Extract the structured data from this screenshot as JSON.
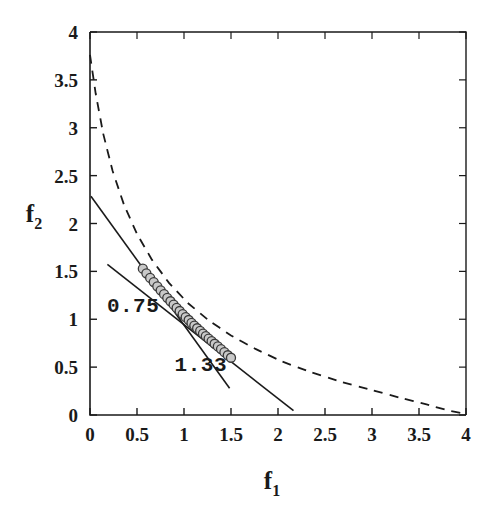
{
  "figure": {
    "background": "#ffffff",
    "ink": "#1a1a1a",
    "marker_fill": "#c9c9c9",
    "marker_edge": "#3a3a3a"
  },
  "chart_data": {
    "type": "scatter",
    "title": "",
    "subtitle": "",
    "xlabel": "f1",
    "ylabel": "f2",
    "xlabel_display": "f",
    "xlabel_sub": "1",
    "ylabel_display": "f",
    "ylabel_sub": "2",
    "xlim": [
      0,
      4
    ],
    "ylim": [
      0,
      4
    ],
    "grid": false,
    "legend": "none",
    "xticks": [
      0,
      0.5,
      1,
      1.5,
      2,
      2.5,
      3,
      3.5,
      4
    ],
    "xticklabels": [
      "0",
      "0.5",
      "1",
      "1.5",
      "2",
      "2.5",
      "3",
      "3.5",
      "4"
    ],
    "yticks": [
      0,
      0.5,
      1,
      1.5,
      2,
      2.5,
      3,
      3.5,
      4
    ],
    "yticklabels": [
      "0",
      "0.5",
      "1",
      "1.5",
      "2",
      "2.5",
      "3",
      "3.5",
      "4"
    ],
    "series": [
      {
        "name": "pareto-points",
        "type": "scatter",
        "marker": "circle",
        "marker_size": 9,
        "fill": "#c9c9c9",
        "edge": "#3a3a3a",
        "points": [
          [
            0.562,
            1.528
          ],
          [
            0.6,
            1.48
          ],
          [
            0.64,
            1.432
          ],
          [
            0.678,
            1.388
          ],
          [
            0.716,
            1.344
          ],
          [
            0.752,
            1.302
          ],
          [
            0.788,
            1.262
          ],
          [
            0.822,
            1.224
          ],
          [
            0.856,
            1.188
          ],
          [
            0.89,
            1.152
          ],
          [
            0.922,
            1.118
          ],
          [
            0.954,
            1.086
          ],
          [
            0.986,
            1.054
          ],
          [
            1.018,
            1.022
          ],
          [
            1.05,
            0.992
          ],
          [
            1.08,
            0.962
          ],
          [
            1.11,
            0.934
          ],
          [
            1.14,
            0.906
          ],
          [
            1.172,
            0.878
          ],
          [
            1.202,
            0.85
          ],
          [
            1.232,
            0.824
          ],
          [
            1.262,
            0.798
          ],
          [
            1.294,
            0.772
          ],
          [
            1.326,
            0.744
          ],
          [
            1.36,
            0.716
          ],
          [
            1.394,
            0.688
          ],
          [
            1.43,
            0.656
          ],
          [
            1.466,
            0.624
          ],
          [
            1.5,
            0.598
          ]
        ]
      },
      {
        "name": "tangent-line-0.75",
        "type": "line",
        "style": "solid",
        "width": 1.6,
        "label": "0.75",
        "slope": -0.7,
        "endpoints": [
          [
            0.185,
            1.572
          ],
          [
            2.165,
            0.045
          ]
        ]
      },
      {
        "name": "tangent-line-1.33",
        "type": "line",
        "style": "solid",
        "width": 1.6,
        "label": "1.33",
        "slope": -1.36,
        "endpoints": [
          [
            0.01,
            2.285
          ],
          [
            1.485,
            0.28
          ]
        ]
      },
      {
        "name": "reference-curve",
        "type": "line",
        "style": "dashed",
        "width": 1.8,
        "dash": "9 7",
        "points": [
          [
            0.0,
            3.76
          ],
          [
            0.06,
            3.36
          ],
          [
            0.14,
            2.94
          ],
          [
            0.24,
            2.55
          ],
          [
            0.36,
            2.2
          ],
          [
            0.5,
            1.89
          ],
          [
            0.66,
            1.62
          ],
          [
            0.84,
            1.38
          ],
          [
            1.04,
            1.17
          ],
          [
            1.26,
            0.99
          ],
          [
            1.5,
            0.83
          ],
          [
            1.76,
            0.69
          ],
          [
            2.04,
            0.56
          ],
          [
            2.34,
            0.45
          ],
          [
            2.66,
            0.35
          ],
          [
            3.0,
            0.26
          ],
          [
            3.3,
            0.18
          ],
          [
            3.58,
            0.11
          ],
          [
            3.8,
            0.05
          ],
          [
            4.0,
            0.01
          ]
        ]
      }
    ],
    "annotations": [
      {
        "name": "slope-label-0.75",
        "text": "0.75",
        "x": 0.18,
        "y": 1.08
      },
      {
        "name": "slope-label-1.33",
        "text": "1.33",
        "x": 0.9,
        "y": 0.46
      }
    ]
  }
}
